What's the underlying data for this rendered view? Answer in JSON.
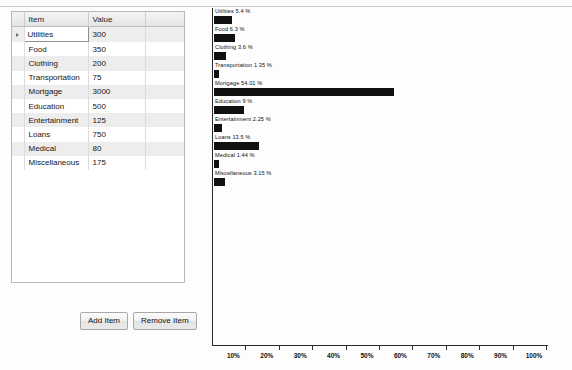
{
  "grid": {
    "columns": [
      "",
      "Item",
      "Value",
      ""
    ],
    "rows": [
      {
        "item": "Utilities",
        "value": "300",
        "selected": true
      },
      {
        "item": "Food",
        "value": "350",
        "selected": false
      },
      {
        "item": "Clothing",
        "value": "200",
        "selected": false
      },
      {
        "item": "Transportation",
        "value": "75",
        "selected": false
      },
      {
        "item": "Mortgage",
        "value": "3000",
        "selected": false
      },
      {
        "item": "Education",
        "value": "500",
        "selected": false
      },
      {
        "item": "Entertainment",
        "value": "125",
        "selected": false
      },
      {
        "item": "Loans",
        "value": "750",
        "selected": false
      },
      {
        "item": "Medical",
        "value": "80",
        "selected": false
      },
      {
        "item": "Miscellaneous",
        "value": "175",
        "selected": false
      }
    ],
    "selector_icon": "row-selector-arrow-icon"
  },
  "buttons": {
    "add_label": "Add Item",
    "remove_label": "Remove Item"
  },
  "colors": {
    "bar": "#111111",
    "axis": "#2a2a2a",
    "grid_header": "#e4e4e4",
    "grid_alt_row": "#ededed",
    "page_background": "#fdfdfd"
  },
  "chart_data": {
    "type": "bar",
    "orientation": "horizontal",
    "title": "",
    "xlabel": "",
    "ylabel": "",
    "xlim": [
      0,
      100
    ],
    "grid": false,
    "legend": null,
    "xticks": [
      10,
      20,
      30,
      40,
      50,
      60,
      70,
      80,
      90,
      100
    ],
    "xticklabels": [
      "10%",
      "20%",
      "30%",
      "40%",
      "50%",
      "60%",
      "70%",
      "80%",
      "90%",
      "100%"
    ],
    "categories": [
      "Utilities",
      "Food",
      "Clothing",
      "Transportation",
      "Mortgage",
      "Education",
      "Entertainment",
      "Loans",
      "Medical",
      "Miscellaneous"
    ],
    "values": [
      5.4,
      6.3,
      3.6,
      1.35,
      54.01,
      9,
      2.25,
      13.5,
      1.44,
      3.15
    ],
    "raw_values": [
      300,
      350,
      200,
      75,
      3000,
      500,
      125,
      750,
      80,
      175
    ],
    "total": 5555,
    "annotations": [
      "Utilities  5.4 %",
      "Food  6.3 %",
      "Clothing  3.6 %",
      "Transportation  1.35 %",
      "Mortgage  54.01 %",
      "Education  9 %",
      "Entertainment  2.25 %",
      "Loans  13.5 %",
      "Medical  1.44 %",
      "Miscellaneous  3.15 %"
    ]
  }
}
